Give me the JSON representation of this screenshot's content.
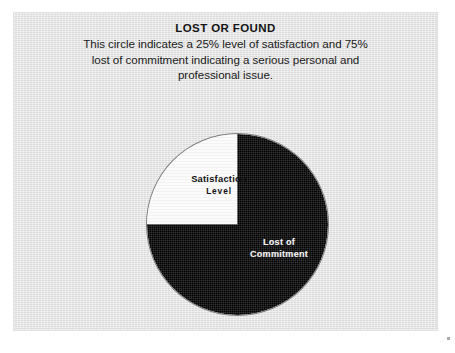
{
  "slide": {
    "title": "LOST OR FOUND",
    "body_lines": [
      "This circle indicates a 25% level of satisfaction and 75%",
      "lost of commitment indicating a serious personal and",
      "professional issue."
    ],
    "background_color": "#e4e4e4"
  },
  "chart_data": {
    "type": "pie",
    "title": "LOST OR FOUND",
    "subtitle": "This circle indicates a 25% level of satisfaction and 75% lost of commitment indicating a serious personal and professional issue.",
    "categories": [
      "Satisfaction Level",
      "Lost of Commitment"
    ],
    "values": [
      25,
      75
    ],
    "unit": "%",
    "colors": [
      "#fbfbfb",
      "#000000"
    ],
    "legend": "none",
    "labels_inside": true,
    "start_angle_deg": 270,
    "direction": "clockwise",
    "slices": [
      {
        "name": "Satisfaction Level",
        "label_line1": "Satisfaction",
        "label_line2": "Level",
        "value": 25,
        "color": "#fbfbfb",
        "text_color": "#101010"
      },
      {
        "name": "Lost of Commitment",
        "label_line1": "Lost of",
        "label_line2": "Commitment",
        "value": 75,
        "color": "#000000",
        "text_color": "#f2f2f2"
      }
    ]
  }
}
